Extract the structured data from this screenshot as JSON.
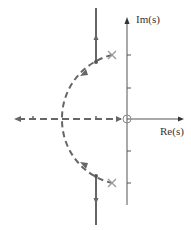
{
  "diagram": {
    "type": "root-locus",
    "axes": {
      "imag_label": "Im(s)",
      "real_label": "Re(s)"
    },
    "poles": [
      {
        "symbol": "x",
        "position": "upper-left"
      },
      {
        "symbol": "x",
        "position": "lower-left"
      }
    ],
    "zeros": [
      {
        "symbol": "o",
        "position": "origin"
      }
    ],
    "colors": {
      "axis": "#555555",
      "locus": "#666666",
      "pole": "#999999"
    }
  }
}
